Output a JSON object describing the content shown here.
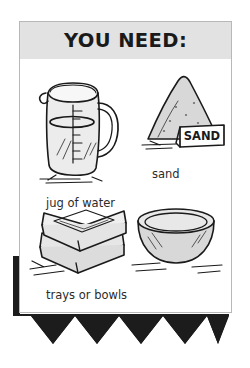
{
  "card": {
    "title": "YOU NEED:",
    "items": [
      {
        "id": "jug",
        "caption": "jug of water",
        "art": "measuring-jug-drawing"
      },
      {
        "id": "sand",
        "caption": "sand",
        "art": "sand-pile-drawing",
        "sign_text": "SAND"
      },
      {
        "id": "trays",
        "caption": "trays or bowls",
        "art": "stacked-trays-drawing"
      },
      {
        "id": "bowl",
        "caption": "",
        "art": "bowl-drawing"
      }
    ]
  },
  "colors": {
    "header_band": "#e2e2e2",
    "card_border": "#b8b8b8",
    "ink": "#1a1a1a",
    "caption_text": "#2b2b2b",
    "shadow": "#1c1c1c",
    "art_fill": "#d8d8d8"
  }
}
